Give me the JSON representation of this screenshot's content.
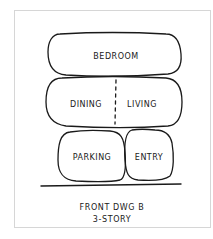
{
  "diagram": {
    "rooms": {
      "bedroom": "BEDROOM",
      "dining": "DINING",
      "living": "LIVING",
      "parking": "PARKING",
      "entry": "ENTRY"
    },
    "caption": {
      "line1": "FRONT DWG B",
      "line2": "3-STORY"
    },
    "colors": {
      "ink": "#1a1a1a",
      "frame": "#d6d6d6"
    }
  }
}
